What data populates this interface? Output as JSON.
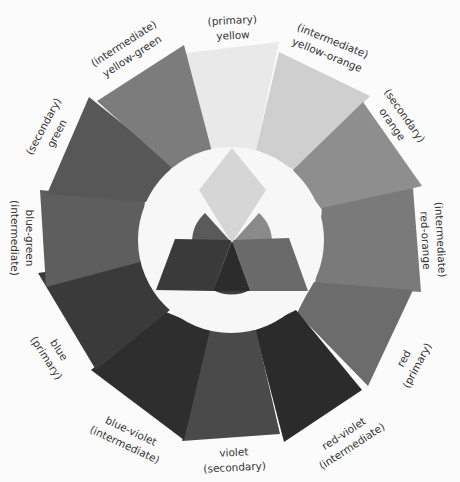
{
  "diagram": {
    "center": {
      "x": 231,
      "y": 240
    },
    "inner_circle_radius": 93,
    "inner_circle_color": "#f7f7f7",
    "segments": [
      {
        "name": "yellow",
        "category": "primary",
        "color": "#e9e9e9",
        "points": "185,53 279,42 256,150 208,150"
      },
      {
        "name": "yellow-orange",
        "category": "intermediate",
        "color": "#cfcfcf",
        "points": "279,52 370,96 298,172 256,150"
      },
      {
        "name": "orange",
        "category": "secondary",
        "color": "#8e8e8e",
        "points": "363,102 422,186 322,210 293,170"
      },
      {
        "name": "red-orange",
        "category": "intermediate",
        "color": "#7a7a7a",
        "points": "413,188 421,292 315,285 322,208"
      },
      {
        "name": "red",
        "category": "primary",
        "color": "#6c6c6c",
        "points": "413,290 368,386 297,313 313,282"
      },
      {
        "name": "red-violet",
        "category": "intermediate",
        "color": "#2b2b2b",
        "points": "362,390 284,442 255,330 296,310"
      },
      {
        "name": "violet",
        "category": "secondary",
        "color": "#4a4a4a",
        "points": "280,434 182,441 207,330 256,330"
      },
      {
        "name": "blue-violet",
        "category": "intermediate",
        "color": "#2e2e2e",
        "points": "184,440 91,370 166,312 210,330"
      },
      {
        "name": "blue",
        "category": "primary",
        "color": "#3a3a3a",
        "points": "96,370 38,273 140,258 170,310"
      },
      {
        "name": "blue-green",
        "category": "intermediate",
        "color": "#5e5e5e",
        "points": "46,287 40,190 145,200 140,262"
      },
      {
        "name": "green",
        "category": "secondary",
        "color": "#575757",
        "points": "47,194 89,97 174,165 146,202"
      },
      {
        "name": "yellow-green",
        "category": "intermediate",
        "color": "#7c7c7c",
        "points": "97,101 184,45 212,152 172,168"
      }
    ],
    "labels": [
      {
        "line1": "(primary)",
        "line2": "yellow",
        "x": 232,
        "y": 28,
        "rotate": -3
      },
      {
        "line1": "(intermediate)",
        "line2": "yellow-orange",
        "x": 330,
        "y": 48,
        "rotate": 22
      },
      {
        "line1": "(secondary)",
        "line2": "orange",
        "x": 398,
        "y": 120,
        "rotate": 55
      },
      {
        "line1": "(intermediate)",
        "line2": "red-orange",
        "x": 433,
        "y": 240,
        "rotate": 87
      },
      {
        "line1": "red",
        "line2": "(primary)",
        "x": 410,
        "y": 362,
        "rotate": -62
      },
      {
        "line1": "red-violet",
        "line2": "(intermediate)",
        "x": 348,
        "y": 440,
        "rotate": -33
      },
      {
        "line1": "violet",
        "line2": "(secondary)",
        "x": 234,
        "y": 460,
        "rotate": -3
      },
      {
        "line1": "blue-violet",
        "line2": "(intermediate)",
        "x": 128,
        "y": 438,
        "rotate": 25
      },
      {
        "line1": "blue",
        "line2": "(primary)",
        "x": 52,
        "y": 354,
        "rotate": 57
      },
      {
        "line1": "blue-green",
        "line2": "(intermediate)",
        "x": 22,
        "y": 238,
        "rotate": 90
      },
      {
        "line1": "(secondary)",
        "line2": "green",
        "x": 50,
        "y": 130,
        "rotate": -62
      },
      {
        "line1": "(intermediate)",
        "line2": "yellow-green",
        "x": 128,
        "y": 50,
        "rotate": -33
      }
    ],
    "center_figure": {
      "disc": {
        "cx": 232,
        "cy": 243,
        "r": 40
      },
      "disc_sectors": [
        {
          "name": "green-sector",
          "color": "#5a5a5a",
          "d": "M232,243 L205,213 A40,40 0 0,0 192,243 Z"
        },
        {
          "name": "orange-sector",
          "color": "#8a8a8a",
          "d": "M232,243 L259,213 A40,40 0 0,1 272,243 Z"
        },
        {
          "name": "violet-sector",
          "color": "#3e3e3e",
          "d": "M213,290 L232,243 L250,290 A40,40 0 0,1 213,290 Z"
        }
      ],
      "diamond": {
        "color": "#d6d6d6",
        "points": "232,148 266,190 232,243 199,190"
      },
      "left_parallelogram": {
        "color": "#3a3a3a",
        "points": "175,239 232,240 213,291 156,290"
      },
      "right_parallelogram": {
        "color": "#6a6a6a",
        "points": "232,240 289,238 308,291 250,291"
      },
      "overlap_center": {
        "color": "#2c2c2c",
        "points": "232,240 213,291 250,291"
      }
    }
  }
}
